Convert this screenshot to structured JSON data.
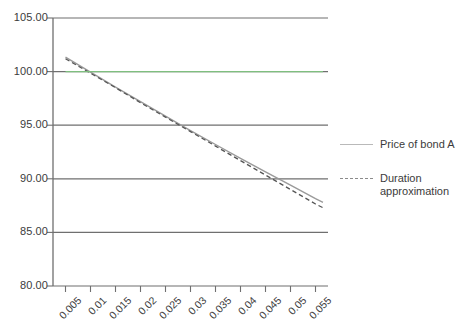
{
  "chart_data": {
    "type": "line",
    "title": "",
    "xlabel": "",
    "ylabel": "",
    "xlim": [
      0.0025,
      0.0575
    ],
    "ylim": [
      80.0,
      105.0
    ],
    "grid": true,
    "grid_axis": "y",
    "legend_position": "right",
    "x_tick_labels": [
      "0.005",
      "0.01",
      "0.015",
      "0.02",
      "0.025",
      "0.03",
      "0.035",
      "0.04",
      "0.045",
      "0.05",
      "0.055"
    ],
    "x_ticks": [
      0.005,
      0.01,
      0.015,
      0.02,
      0.025,
      0.03,
      0.035,
      0.04,
      0.045,
      0.05,
      0.055
    ],
    "y_tick_labels": [
      "80.00",
      "85.00",
      "90.00",
      "95.00",
      "100.00",
      "105.00"
    ],
    "y_ticks": [
      80.0,
      85.0,
      90.0,
      95.0,
      100.0,
      105.0
    ],
    "x": [
      0.005,
      0.01,
      0.015,
      0.02,
      0.025,
      0.03,
      0.035,
      0.04,
      0.045,
      0.05,
      0.055,
      0.0565
    ],
    "series": [
      {
        "name": "Price of bond A",
        "style": "solid",
        "color": "#9a9a9a",
        "values": [
          101.35,
          99.95,
          98.55,
          97.2,
          95.85,
          94.5,
          93.2,
          91.9,
          90.65,
          89.4,
          88.15,
          87.8
        ]
      },
      {
        "name": "Duration approximation",
        "style": "dashed",
        "color": "#555555",
        "values": [
          101.2,
          99.85,
          98.5,
          97.1,
          95.75,
          94.4,
          93.05,
          91.7,
          90.35,
          89.0,
          87.65,
          87.3
        ]
      },
      {
        "name": "Par value",
        "style": "solid",
        "color": "#7fbf7f",
        "values": [
          100.0,
          100.0,
          100.0,
          100.0,
          100.0,
          100.0,
          100.0,
          100.0,
          100.0,
          100.0,
          100.0,
          100.0
        ]
      }
    ],
    "annotations": []
  },
  "legend": {
    "items": [
      {
        "label": "Price of bond A",
        "style": "solid"
      },
      {
        "label": "Duration approximation",
        "style": "dashed"
      }
    ]
  },
  "colors": {
    "axis": "#6f6f6f",
    "grid": "#6f6f6f",
    "par_line": "#7fbf7f",
    "price_line": "#9a9a9a",
    "duration_line": "#555555",
    "text": "#3b3b3b",
    "background": "#ffffff"
  }
}
